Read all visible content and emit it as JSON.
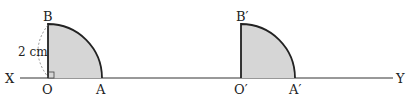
{
  "labels": {
    "x": "X",
    "y": "Y",
    "o": "O",
    "a": "A",
    "b": "B",
    "o_prime": "O′",
    "a_prime": "A′",
    "b_prime": "B′",
    "radius": "2 cm"
  },
  "colors": {
    "fill": "#d6d6d6",
    "stroke": "#222222",
    "dashed": "#777777"
  }
}
